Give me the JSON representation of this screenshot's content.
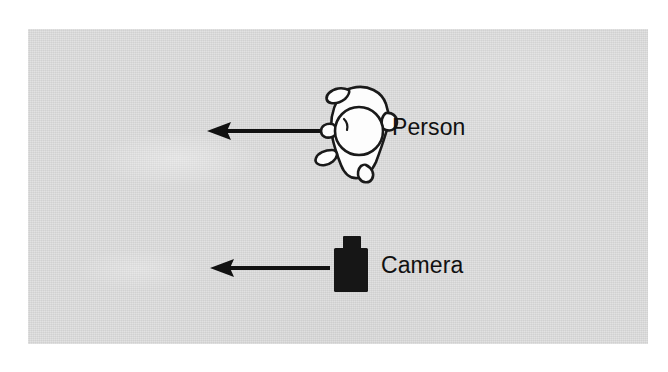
{
  "figure": {
    "kind": "diagram-photo",
    "canvas": {
      "width": 668,
      "height": 372
    },
    "background_color": "#ffffff",
    "panel": {
      "color": "#d6d6d6",
      "x": 28,
      "y": 29,
      "width": 620,
      "height": 315
    }
  },
  "labels": {
    "person": "Person",
    "camera": "Camera"
  },
  "elements": [
    {
      "id": "person",
      "icon": "person-top-down-icon",
      "label": "Person",
      "outline_color": "#1a1a1a",
      "fill_color": "#fdfdfd",
      "center": {
        "x": 358,
        "y": 130
      }
    },
    {
      "id": "camera",
      "icon": "camera-silhouette-icon",
      "label": "Camera",
      "fill_color": "#1a1a1a",
      "center": {
        "x": 351,
        "y": 264
      }
    }
  ],
  "arrows": [
    {
      "id": "person-motion-arrow",
      "name": "Person motion direction",
      "direction": "left",
      "color": "#111111",
      "from": {
        "x": 325,
        "y": 131
      },
      "to": {
        "x": 207,
        "y": 131
      }
    },
    {
      "id": "camera-motion-arrow",
      "name": "Camera motion direction",
      "direction": "left",
      "color": "#111111",
      "from": {
        "x": 330,
        "y": 268
      },
      "to": {
        "x": 210,
        "y": 268
      }
    }
  ]
}
